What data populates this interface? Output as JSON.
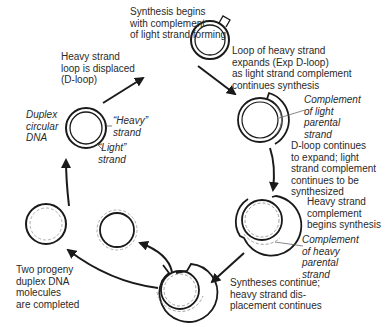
{
  "diagram": {
    "colors": {
      "stroke": "#1a1a1a",
      "dashed": "#8a8a8a",
      "text": "#2a2a2a",
      "background": "#ffffff"
    },
    "labels": {
      "synthesis_begins": "Synthesis begins\nwith complement\nof light strand forming",
      "d_loop_displaced": "Heavy strand\nloop is displaced\n(D-loop)",
      "loop_expands": "Loop of heavy strand\nexpands (Exp D-loop)\nas light strand complement\ncontinues synthesis",
      "duplex_circular": "Duplex\ncircular\nDNA",
      "heavy_strand": "“Heavy”\nstrand",
      "light_strand": "“Light”\nstrand",
      "complement_light": "Complement\nof light\nparental\nstrand",
      "d_loop_continues": "D-loop continues\nto expand; light\nstrand complement\ncontinues to be\nsynthesized",
      "heavy_complement_begins": "Heavy strand\ncomplement\nbegins synthesis",
      "complement_heavy": "Complement\nof heavy\nparental\nstrand",
      "syntheses_continue": "Syntheses continue;\nheavy strand dis-\nplacement continues",
      "two_progeny": "Two progeny\nduplex DNA\nmolecules\nare completed"
    },
    "stages": [
      {
        "id": "duplex",
        "name": "Duplex circular DNA"
      },
      {
        "id": "d-loop",
        "name": "D-loop formation"
      },
      {
        "id": "exp-d-loop",
        "name": "Expanded D-loop"
      },
      {
        "id": "d-loop-continues",
        "name": "D-loop continues"
      },
      {
        "id": "heavy-complement",
        "name": "Heavy strand complement synthesis"
      },
      {
        "id": "separation",
        "name": "Progeny separation"
      },
      {
        "id": "progeny-1",
        "name": "Progeny duplex 1"
      },
      {
        "id": "progeny-2",
        "name": "Progeny duplex 2"
      }
    ]
  }
}
